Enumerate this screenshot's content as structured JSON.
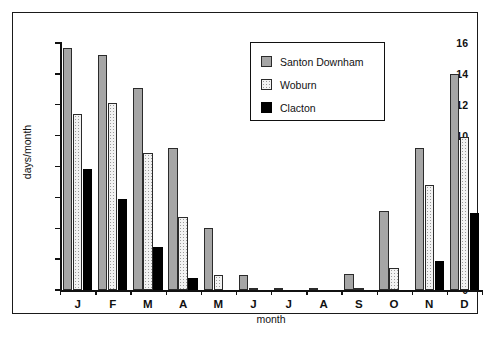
{
  "chart_data": {
    "type": "bar",
    "title": "",
    "xlabel": "month",
    "ylabel": "days/month",
    "ylim": [
      0,
      16
    ],
    "yticks": [
      0,
      2,
      4,
      6,
      8,
      10,
      12,
      14,
      16
    ],
    "grid": false,
    "legend_position": "top-right",
    "categories": [
      "J",
      "F",
      "M",
      "A",
      "M",
      "J",
      "J",
      "A",
      "S",
      "O",
      "N",
      "D"
    ],
    "series": [
      {
        "name": "Santon Downham",
        "color": "#a6a6a6",
        "values": [
          15.7,
          15.2,
          13.1,
          9.2,
          4.0,
          1.0,
          0.05,
          0.1,
          1.05,
          5.1,
          9.2,
          14.0
        ]
      },
      {
        "name": "Woburn",
        "color": "#f2f2f2",
        "values": [
          11.4,
          12.1,
          8.9,
          4.7,
          1.0,
          0.1,
          0.0,
          0.0,
          0.1,
          1.4,
          6.8,
          9.9
        ]
      },
      {
        "name": "Clacton",
        "color": "#000000",
        "values": [
          7.85,
          5.9,
          2.8,
          0.75,
          0.0,
          0.0,
          0.0,
          0.0,
          0.0,
          0.0,
          1.9,
          5.0
        ]
      }
    ]
  },
  "legend": {
    "entries": [
      {
        "label": "Santon Downham",
        "swatch": "solid-gray-swatch"
      },
      {
        "label": "Woburn",
        "swatch": "dotted-light-swatch"
      },
      {
        "label": "Clacton",
        "swatch": "solid-black-swatch"
      }
    ]
  },
  "caption": ""
}
